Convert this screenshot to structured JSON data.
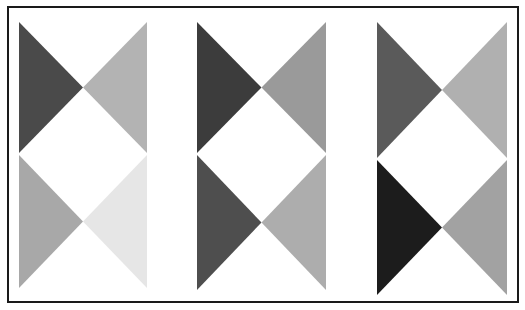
{
  "figure": {
    "width": 525,
    "height": 310,
    "background": "#ffffff",
    "frame": {
      "x": 8,
      "y": 7,
      "width": 510,
      "height": 295,
      "stroke": "#1a1a1a",
      "stroke_width": 2
    },
    "panels": [
      {
        "name": "left",
        "x0": 19,
        "x1": 147,
        "top": {
          "y0": 22,
          "y1": 153,
          "left_color": "#4a4a4a",
          "right_color": "#b3b3b3"
        },
        "bottom": {
          "y0": 155,
          "y1": 288,
          "left_color": "#a8a8a8",
          "right_color": "#e6e6e6"
        }
      },
      {
        "name": "middle",
        "x0": 197,
        "x1": 326,
        "top": {
          "y0": 22,
          "y1": 153,
          "left_color": "#3c3c3c",
          "right_color": "#9a9a9a"
        },
        "bottom": {
          "y0": 155,
          "y1": 290,
          "left_color": "#4e4e4e",
          "right_color": "#adadad"
        }
      },
      {
        "name": "right",
        "x0": 377,
        "x1": 507,
        "top": {
          "y0": 22,
          "y1": 158,
          "left_color": "#5a5a5a",
          "right_color": "#b0b0b0"
        },
        "bottom": {
          "y0": 160,
          "y1": 295,
          "left_color": "#1c1c1c",
          "right_color": "#a2a2a2"
        }
      }
    ]
  }
}
